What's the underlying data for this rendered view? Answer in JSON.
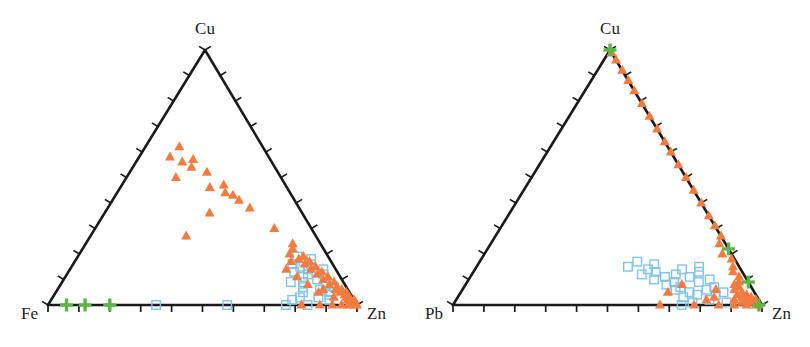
{
  "figure": {
    "title": "",
    "background_color": "#ffffff",
    "panel_count": 2
  },
  "style": {
    "triangle_marker_color": "#f47b3f",
    "square_marker_color": "#7fc4e8",
    "cross_marker_color": "#5cb548",
    "axis_color": "#1a1a1a",
    "label_color": "#1d1d1d"
  },
  "chart_data": [
    {
      "type": "scatter",
      "plot_kind": "ternary",
      "panel": "left",
      "title": "",
      "vertices": {
        "top": "Cu",
        "left": "Fe",
        "right": "Zn"
      },
      "axis_labels": [
        "Cu",
        "Fe",
        "Zn"
      ],
      "ticks_per_edge": 10,
      "axis_range": [
        0,
        100
      ],
      "grid": false,
      "legend": "none",
      "geometry_px": {
        "apex": [
          205,
          50
        ],
        "left_vertex": [
          48,
          305
        ],
        "right_vertex": [
          357,
          305
        ]
      },
      "series": [
        {
          "name": "orange-triangles",
          "marker": "triangle-filled",
          "color": "#f47b3f",
          "points_ternary": [
            [
              62,
              27,
              11
            ],
            [
              58,
              32,
              10
            ],
            [
              56,
              29,
              15
            ],
            [
              57,
              25,
              18
            ],
            [
              54,
              27,
              19
            ],
            [
              52,
              23,
              25
            ],
            [
              50,
              34,
              16
            ],
            [
              46,
              25,
              29
            ],
            [
              47,
              20,
              33
            ],
            [
              44,
              21,
              35
            ],
            [
              43,
              19,
              38
            ],
            [
              41,
              18,
              41
            ],
            [
              38,
              16,
              46
            ],
            [
              36,
              30,
              34
            ],
            [
              30,
              12,
              58
            ],
            [
              27,
              42,
              31
            ],
            [
              24,
              9,
              67
            ],
            [
              22,
              10,
              68
            ],
            [
              20,
              12,
              68
            ],
            [
              19,
              8,
              73
            ],
            [
              18,
              10,
              72
            ],
            [
              17,
              7,
              76
            ],
            [
              16,
              9,
              75
            ],
            [
              15,
              6,
              79
            ],
            [
              14,
              8,
              78
            ],
            [
              13,
              5,
              82
            ],
            [
              12,
              7,
              81
            ],
            [
              11,
              4,
              85
            ],
            [
              10,
              6,
              84
            ],
            [
              9,
              3,
              88
            ],
            [
              8,
              5,
              87
            ],
            [
              7,
              3,
              90
            ],
            [
              6,
              4,
              90
            ],
            [
              6,
              2,
              92
            ],
            [
              5,
              3,
              92
            ],
            [
              5,
              1,
              94
            ],
            [
              4,
              2,
              94
            ],
            [
              4,
              1,
              95
            ],
            [
              3,
              2,
              95
            ],
            [
              3,
              1,
              96
            ],
            [
              2,
              1,
              97
            ],
            [
              2,
              2,
              96
            ],
            [
              2,
              0,
              98
            ],
            [
              1,
              1,
              98
            ],
            [
              1,
              0,
              99
            ],
            [
              1,
              2,
              97
            ],
            [
              0,
              1,
              99
            ],
            [
              0,
              0,
              100
            ],
            [
              0,
              3,
              97
            ],
            [
              0,
              5,
              95
            ],
            [
              0,
              8,
              92
            ],
            [
              0,
              12,
              88
            ],
            [
              0,
              18,
              82
            ],
            [
              6,
              8,
              86
            ],
            [
              8,
              12,
              80
            ],
            [
              11,
              14,
              75
            ],
            [
              14,
              16,
              70
            ],
            [
              17,
              13,
              70
            ],
            [
              5,
              10,
              85
            ],
            [
              3,
              6,
              91
            ]
          ]
        },
        {
          "name": "blue-squares",
          "marker": "square-open",
          "color": "#7fc4e8",
          "points_ternary": [
            [
              0,
              65,
              35
            ],
            [
              0,
              42,
              58
            ],
            [
              0,
              23,
              77
            ],
            [
              0,
              16,
              84
            ],
            [
              2,
              20,
              78
            ],
            [
              3,
              17,
              80
            ],
            [
              5,
              15,
              80
            ],
            [
              7,
              14,
              79
            ],
            [
              9,
              13,
              78
            ],
            [
              11,
              12,
              77
            ],
            [
              12,
              10,
              78
            ],
            [
              13,
              14,
              73
            ],
            [
              14,
              9,
              77
            ],
            [
              15,
              11,
              74
            ],
            [
              16,
              7,
              77
            ],
            [
              17,
              9,
              74
            ],
            [
              18,
              6,
              76
            ],
            [
              19,
              10,
              71
            ],
            [
              10,
              8,
              82
            ],
            [
              8,
              6,
              86
            ],
            [
              6,
              9,
              85
            ],
            [
              4,
              7,
              89
            ],
            [
              12,
              5,
              83
            ],
            [
              14,
              4,
              82
            ],
            [
              7,
              4,
              89
            ],
            [
              5,
              6,
              89
            ],
            [
              16,
              13,
              71
            ],
            [
              9,
              17,
              74
            ],
            [
              3,
              11,
              86
            ],
            [
              2,
              8,
              90
            ]
          ]
        },
        {
          "name": "green-crosses",
          "marker": "cross",
          "color": "#5cb548",
          "points_ternary": [
            [
              0,
              94,
              6
            ],
            [
              0,
              88,
              12
            ],
            [
              0,
              80,
              20
            ]
          ]
        }
      ]
    },
    {
      "type": "scatter",
      "plot_kind": "ternary",
      "panel": "right",
      "title": "",
      "vertices": {
        "top": "Cu",
        "left": "Pb",
        "right": "Zn"
      },
      "axis_labels": [
        "Cu",
        "Pb",
        "Zn"
      ],
      "ticks_per_edge": 10,
      "axis_range": [
        0,
        100
      ],
      "grid": false,
      "legend": "none",
      "geometry_px": {
        "apex": [
          610,
          50
        ],
        "left_vertex": [
          453,
          305
        ],
        "right_vertex": [
          762,
          305
        ]
      },
      "series": [
        {
          "name": "orange-triangles",
          "marker": "triangle-filled",
          "color": "#f47b3f",
          "points_ternary": [
            [
              99,
              0,
              1
            ],
            [
              96,
              0,
              4
            ],
            [
              92,
              0,
              8
            ],
            [
              88,
              0,
              12
            ],
            [
              84,
              0,
              16
            ],
            [
              79,
              0,
              21
            ],
            [
              74,
              0,
              26
            ],
            [
              69,
              0,
              31
            ],
            [
              64,
              0,
              36
            ],
            [
              60,
              0,
              40
            ],
            [
              55,
              0,
              45
            ],
            [
              50,
              0,
              50
            ],
            [
              45,
              0,
              55
            ],
            [
              40,
              0,
              60
            ],
            [
              35,
              0,
              65
            ],
            [
              31,
              0,
              69
            ],
            [
              27,
              0,
              73
            ],
            [
              24,
              2,
              74
            ],
            [
              20,
              3,
              77
            ],
            [
              18,
              1,
              81
            ],
            [
              15,
              2,
              83
            ],
            [
              13,
              3,
              84
            ],
            [
              11,
              2,
              87
            ],
            [
              9,
              3,
              88
            ],
            [
              8,
              5,
              87
            ],
            [
              7,
              4,
              89
            ],
            [
              6,
              6,
              88
            ],
            [
              5,
              4,
              91
            ],
            [
              4,
              6,
              90
            ],
            [
              4,
              3,
              93
            ],
            [
              3,
              5,
              92
            ],
            [
              3,
              2,
              95
            ],
            [
              2,
              4,
              94
            ],
            [
              2,
              8,
              90
            ],
            [
              2,
              1,
              97
            ],
            [
              1,
              3,
              96
            ],
            [
              1,
              6,
              93
            ],
            [
              1,
              1,
              98
            ],
            [
              0,
              2,
              98
            ],
            [
              0,
              5,
              95
            ],
            [
              0,
              9,
              91
            ],
            [
              0,
              14,
              86
            ],
            [
              0,
              22,
              78
            ],
            [
              0,
              33,
              67
            ],
            [
              5,
              28,
              67
            ],
            [
              8,
              22,
              70
            ],
            [
              3,
              14,
              83
            ],
            [
              6,
              12,
              82
            ],
            [
              2,
              17,
              81
            ],
            [
              0,
              1,
              99
            ]
          ]
        },
        {
          "name": "blue-squares",
          "marker": "square-open",
          "color": "#7fc4e8",
          "points_ternary": [
            [
              15,
              36,
              49
            ],
            [
              17,
              32,
              51
            ],
            [
              14,
              30,
              56
            ],
            [
              16,
              27,
              57
            ],
            [
              12,
              33,
              55
            ],
            [
              13,
              28,
              59
            ],
            [
              11,
              26,
              63
            ],
            [
              10,
              30,
              60
            ],
            [
              9,
              24,
              67
            ],
            [
              12,
              22,
              66
            ],
            [
              8,
              27,
              65
            ],
            [
              7,
              23,
              70
            ],
            [
              14,
              19,
              67
            ],
            [
              11,
              18,
              71
            ],
            [
              6,
              25,
              69
            ],
            [
              5,
              21,
              74
            ],
            [
              9,
              16,
              75
            ],
            [
              13,
              14,
              73
            ],
            [
              15,
              13,
              72
            ],
            [
              4,
              19,
              77
            ],
            [
              3,
              24,
              73
            ],
            [
              7,
              12,
              81
            ],
            [
              5,
              10,
              85
            ],
            [
              2,
              16,
              82
            ],
            [
              10,
              12,
              78
            ],
            [
              1,
              22,
              77
            ],
            [
              0,
              26,
              74
            ],
            [
              6,
              15,
              79
            ],
            [
              4,
              13,
              83
            ],
            [
              1,
              11,
              88
            ]
          ]
        },
        {
          "name": "green-crosses",
          "marker": "cross",
          "color": "#5cb548",
          "points_ternary": [
            [
              100,
              0,
              0
            ],
            [
              22,
              0,
              78
            ],
            [
              9,
              0,
              91
            ],
            [
              0,
              1,
              99
            ]
          ]
        }
      ]
    }
  ]
}
